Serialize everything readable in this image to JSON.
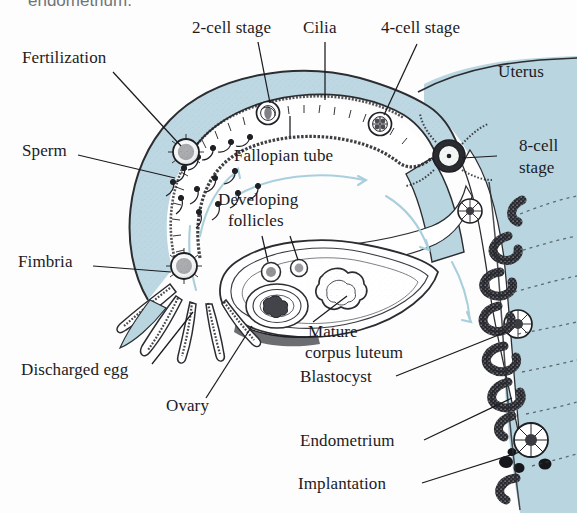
{
  "figure": {
    "background_color": "#fdfdfd",
    "tissue_fill": "#b9d6e0",
    "ink_color": "#1b1b1f",
    "arrow_color": "#a9cfdd",
    "cropped_top_caption": "endometrium."
  },
  "labels": {
    "fertilization": "Fertilization",
    "sperm": "Sperm",
    "fimbria": "Fimbria",
    "discharged_egg": "Discharged egg",
    "ovary": "Ovary",
    "two_cell_stage": "2-cell stage",
    "cilia": "Cilia",
    "four_cell_stage": "4-cell stage",
    "uterus": "Uterus",
    "eight_cell_stage_line1": "8-cell",
    "eight_cell_stage_line2": "stage",
    "fallopian_tube": "Fallopian tube",
    "developing_follicles_line1": "Developing",
    "developing_follicles_line2": "follicles",
    "mature_corpus_luteum_line1": "Mature",
    "mature_corpus_luteum_line2": "corpus luteum",
    "blastocyst": "Blastocyst",
    "endometrium": "Endometrium",
    "implantation": "Implantation"
  }
}
